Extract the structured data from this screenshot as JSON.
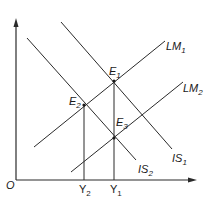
{
  "diagram": {
    "type": "IS-LM diagram",
    "origin_label": "O",
    "curves": {
      "lm1": {
        "label": "LM",
        "sub": "1"
      },
      "lm2": {
        "label": "LM",
        "sub": "2"
      },
      "is1": {
        "label": "IS",
        "sub": "1"
      },
      "is2": {
        "label": "IS",
        "sub": "2"
      }
    },
    "points": {
      "e1": {
        "label": "E",
        "sub": "1"
      },
      "e2": {
        "label": "E",
        "sub": "2"
      },
      "e3": {
        "label": "E",
        "sub": "3"
      }
    },
    "x_ticks": {
      "y2": {
        "label": "Y",
        "sub": "2"
      },
      "y1": {
        "label": "Y",
        "sub": "1"
      }
    },
    "colors": {
      "line": "#2a2a2a",
      "background": "#ffffff"
    }
  }
}
